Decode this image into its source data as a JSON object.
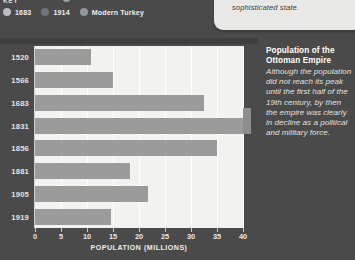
{
  "callout": {
    "text": "sophisticated state."
  },
  "key": {
    "title": "KEY",
    "items": [
      {
        "label": "1683",
        "color": "#b9bdbf",
        "icon": "legend-dot-icon"
      },
      {
        "label": "1914",
        "color": "#6f7479",
        "icon": "legend-dot-icon"
      },
      {
        "label": "Modern Turkey",
        "color": "#8f9599",
        "icon": "legend-dot-icon"
      }
    ]
  },
  "side_note": {
    "title": "Population of the Ottoman Empire",
    "body": "Although the population did not reach its peak until the first half of the 19th century, by then the empire  was clearly in decline as a political and military force."
  },
  "chart_data": {
    "type": "bar",
    "orientation": "horizontal",
    "title": "Population of the Ottoman Empire",
    "xlabel": "POPULATION (MILLIONS)",
    "ylabel": "",
    "categories": [
      "1520",
      "1566",
      "1683",
      "1831",
      "1856",
      "1881",
      "1905",
      "1919"
    ],
    "values": [
      10.8,
      15.0,
      32.5,
      40.0,
      35.0,
      18.3,
      21.7,
      14.6
    ],
    "xlim": [
      0,
      40
    ],
    "xticks": [
      0,
      5,
      10,
      15,
      20,
      25,
      30,
      35,
      40
    ],
    "xticklabels": [
      "0",
      "5",
      "10",
      "15",
      "20",
      "25",
      "30",
      "35",
      "40"
    ],
    "grid": true,
    "bar_color": "#9b9b9b",
    "plot_background": "#f2f2f0",
    "legend": [
      "1683",
      "1914",
      "Modern Turkey"
    ]
  }
}
